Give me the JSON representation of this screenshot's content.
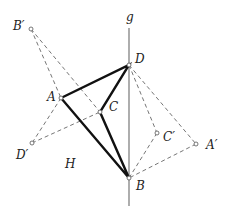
{
  "diagram": {
    "type": "geometry-reflection",
    "colors": {
      "background": "#ffffff",
      "polygon": "#111111",
      "dashed": "#666666",
      "axis": "#777777",
      "text": "#222222"
    },
    "axis": {
      "label": "g",
      "x": 129,
      "y1": 28,
      "y2": 206,
      "label_pos": [
        126,
        21
      ]
    },
    "region_label": {
      "text": "H",
      "pos": [
        65,
        168
      ]
    },
    "points": {
      "A": {
        "label": "A",
        "x": 61,
        "y": 98,
        "label_pos": [
          47,
          101
        ]
      },
      "B": {
        "label": "B",
        "x": 129,
        "y": 178,
        "label_pos": [
          136,
          190
        ]
      },
      "C": {
        "label": "C",
        "x": 100,
        "y": 112,
        "label_pos": [
          109,
          111
        ]
      },
      "D": {
        "label": "D",
        "x": 129,
        "y": 65,
        "label_pos": [
          135,
          63
        ]
      },
      "A_": {
        "label": "A′",
        "x": 196,
        "y": 144,
        "label_pos": [
          206,
          149
        ]
      },
      "B_": {
        "label": "B′",
        "x": 31,
        "y": 29,
        "label_pos": [
          13,
          30
        ]
      },
      "C_": {
        "label": "C′",
        "x": 157,
        "y": 133,
        "label_pos": [
          163,
          141
        ]
      },
      "D_": {
        "label": "D′",
        "x": 32,
        "y": 143,
        "label_pos": [
          16,
          159
        ]
      }
    },
    "polygon": [
      "A",
      "D",
      "C",
      "B"
    ],
    "dashed_segments": [
      [
        "B_",
        "A"
      ],
      [
        "B_",
        "C"
      ],
      [
        "A",
        "D_"
      ],
      [
        "D_",
        "C"
      ],
      [
        "D",
        "C_"
      ],
      [
        "D",
        "A_"
      ],
      [
        "C_",
        "B"
      ],
      [
        "A_",
        "B"
      ]
    ]
  }
}
